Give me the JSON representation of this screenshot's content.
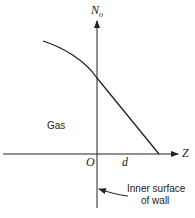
{
  "diagram": {
    "axes": {
      "y_label": "N",
      "y_label_subscript": "o",
      "x_label": "Z",
      "origin_label": "O"
    },
    "regions": {
      "left_label": "Gas",
      "thickness_label": "d"
    },
    "annotation": {
      "line1": "Inner surface",
      "line2": "of wall"
    },
    "colors": {
      "stroke": "#222222",
      "background": "#ffffff"
    }
  }
}
